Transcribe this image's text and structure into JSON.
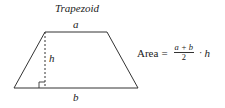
{
  "title": "Trapezoid",
  "labels": {
    "top_base": "a",
    "height": "h",
    "bottom_base": "b"
  },
  "formula": {
    "lhs": "Area",
    "equals": "=",
    "numerator": "a + b",
    "denominator": "2",
    "operator": "·",
    "factor": "h"
  },
  "shape": {
    "vertices": [
      [
        45,
        32
      ],
      [
        107,
        32
      ],
      [
        138,
        88
      ],
      [
        14,
        88
      ]
    ],
    "height_line": {
      "x": 45,
      "y1": 32,
      "y2": 88
    },
    "stroke_color": "#333333"
  }
}
